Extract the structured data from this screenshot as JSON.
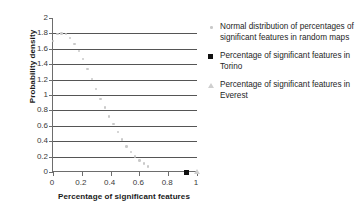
{
  "chart_data": {
    "type": "scatter",
    "title": "",
    "xlabel": "Percentage of significant features",
    "ylabel": "Probability density",
    "xlim": [
      0,
      1
    ],
    "ylim": [
      0,
      2
    ],
    "xticks": [
      "0",
      "0.2",
      "0.4",
      "0.6",
      "0.8",
      "1"
    ],
    "xtick_values": [
      0,
      0.2,
      0.4,
      0.6,
      0.8,
      1
    ],
    "yticks": [
      "0",
      "0.2",
      "0.4",
      "0.6",
      "0.8",
      "1",
      "1.2",
      "1.4",
      "1.6",
      "1.8",
      "2"
    ],
    "ytick_values": [
      0,
      0.2,
      0.4,
      0.6,
      0.8,
      1,
      1.2,
      1.4,
      1.6,
      1.8,
      2
    ],
    "grid": "horizontal",
    "legend_position": "right",
    "series": [
      {
        "name": "Normal distribution of percentages of significant features in random maps",
        "marker": "dot",
        "color": "#c9c9c9",
        "x": [
          0.0,
          0.03,
          0.06,
          0.09,
          0.12,
          0.15,
          0.18,
          0.21,
          0.24,
          0.27,
          0.3,
          0.33,
          0.36,
          0.39,
          0.42,
          0.45,
          0.48,
          0.51,
          0.54,
          0.57,
          0.6,
          0.63,
          0.66
        ],
        "y": [
          1.7,
          1.79,
          1.8,
          1.79,
          1.74,
          1.66,
          1.57,
          1.47,
          1.34,
          1.21,
          1.08,
          0.95,
          0.84,
          0.72,
          0.62,
          0.52,
          0.42,
          0.33,
          0.26,
          0.2,
          0.15,
          0.11,
          0.07
        ]
      },
      {
        "name": "Percentage of significant features in Torino",
        "marker": "square",
        "color": "#111111",
        "x": [
          0.93
        ],
        "y": [
          0.0
        ]
      },
      {
        "name": "Percentage of significant features in Everest",
        "marker": "triangle",
        "color": "#cfcfcf",
        "x": [
          1.0
        ],
        "y": [
          0.0
        ]
      }
    ]
  },
  "legend": {
    "entries": [
      {
        "label": "Normal distribution of percentages of significant features in random maps",
        "symbol": "dot-marker-icon"
      },
      {
        "label": "Percentage of significant features in Torino",
        "symbol": "square-marker-icon"
      },
      {
        "label": "Percentage of significant features in Everest",
        "symbol": "triangle-marker-icon"
      }
    ]
  }
}
